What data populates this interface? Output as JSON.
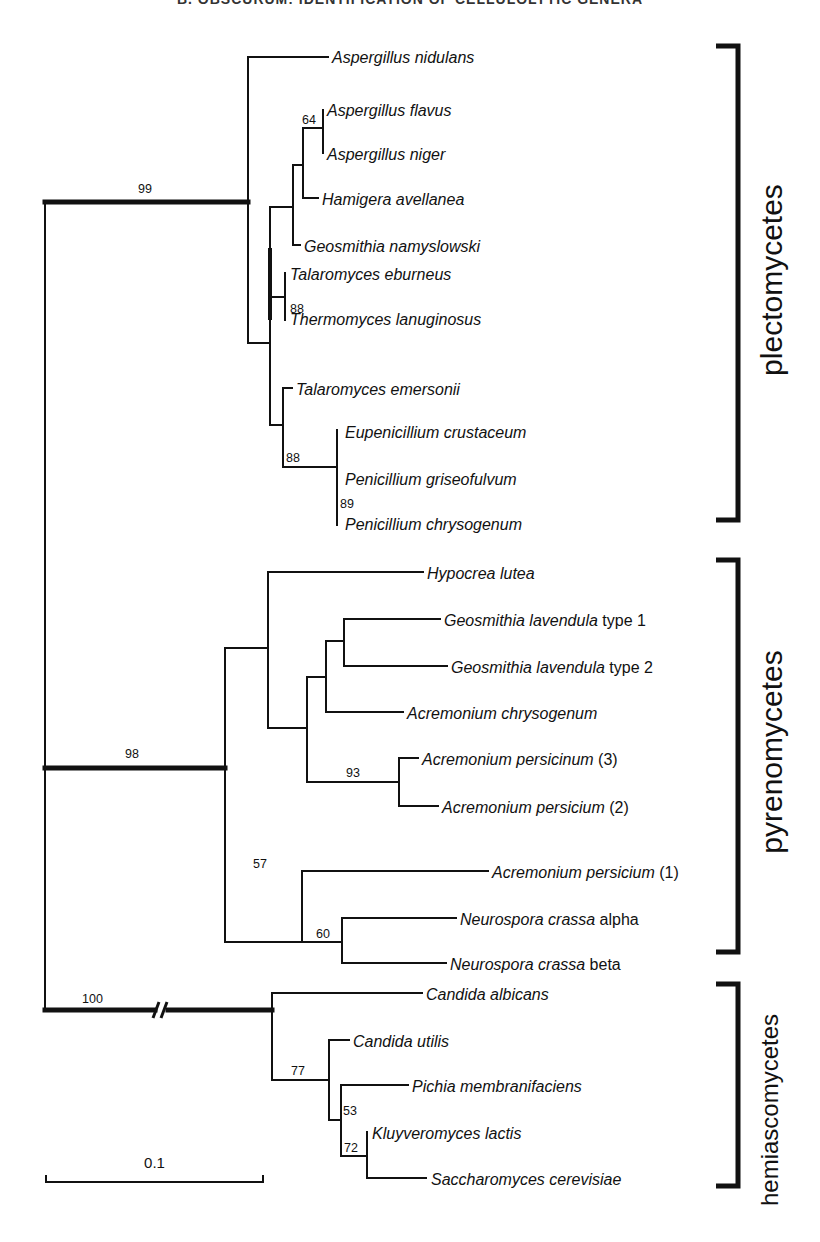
{
  "header": {
    "text": "B. OBSCURUM: IDENTIFICATION OF CELLULOLYTIC GENERA"
  },
  "tree": {
    "stroke_color": "#111111",
    "thin_width": 2,
    "thick_width": 5,
    "branches": [
      {
        "x1": 45,
        "y1": 202,
        "x2": 45,
        "y2": 1010,
        "w": 2
      },
      {
        "x1": 45,
        "y1": 202,
        "x2": 248,
        "y2": 202,
        "w": 5
      },
      {
        "x1": 45,
        "y1": 768,
        "x2": 225,
        "y2": 768,
        "w": 5
      },
      {
        "x1": 45,
        "y1": 1010,
        "x2": 155,
        "y2": 1010,
        "w": 5
      },
      {
        "x1": 168,
        "y1": 1010,
        "x2": 272,
        "y2": 1010,
        "w": 5
      },
      {
        "x1": 248,
        "y1": 57,
        "x2": 248,
        "y2": 343,
        "w": 2
      },
      {
        "x1": 248,
        "y1": 57,
        "x2": 328,
        "y2": 57,
        "w": 2
      },
      {
        "x1": 248,
        "y1": 343,
        "x2": 270,
        "y2": 343,
        "w": 2
      },
      {
        "x1": 270,
        "y1": 207,
        "x2": 270,
        "y2": 425,
        "w": 2
      },
      {
        "x1": 270,
        "y1": 250,
        "x2": 270,
        "y2": 318,
        "w": 4
      },
      {
        "x1": 270,
        "y1": 207,
        "x2": 293,
        "y2": 207,
        "w": 2
      },
      {
        "x1": 293,
        "y1": 165,
        "x2": 293,
        "y2": 245,
        "w": 2
      },
      {
        "x1": 293,
        "y1": 245,
        "x2": 300,
        "y2": 245,
        "w": 2
      },
      {
        "x1": 293,
        "y1": 165,
        "x2": 303,
        "y2": 165,
        "w": 2
      },
      {
        "x1": 303,
        "y1": 128,
        "x2": 303,
        "y2": 198,
        "w": 2
      },
      {
        "x1": 303,
        "y1": 198,
        "x2": 318,
        "y2": 198,
        "w": 2
      },
      {
        "x1": 303,
        "y1": 128,
        "x2": 323,
        "y2": 128,
        "w": 2
      },
      {
        "x1": 323,
        "y1": 110,
        "x2": 323,
        "y2": 153,
        "w": 2
      },
      {
        "x1": 270,
        "y1": 297,
        "x2": 285,
        "y2": 297,
        "w": 2
      },
      {
        "x1": 285,
        "y1": 273,
        "x2": 285,
        "y2": 320,
        "w": 2
      },
      {
        "x1": 270,
        "y1": 425,
        "x2": 283,
        "y2": 425,
        "w": 2
      },
      {
        "x1": 283,
        "y1": 388,
        "x2": 283,
        "y2": 467,
        "w": 2
      },
      {
        "x1": 283,
        "y1": 388,
        "x2": 292,
        "y2": 388,
        "w": 2
      },
      {
        "x1": 283,
        "y1": 467,
        "x2": 337,
        "y2": 467,
        "w": 2
      },
      {
        "x1": 337,
        "y1": 430,
        "x2": 337,
        "y2": 525,
        "w": 2
      },
      {
        "x1": 225,
        "y1": 648,
        "x2": 225,
        "y2": 942,
        "w": 2
      },
      {
        "x1": 225,
        "y1": 648,
        "x2": 268,
        "y2": 648,
        "w": 2
      },
      {
        "x1": 268,
        "y1": 572,
        "x2": 268,
        "y2": 728,
        "w": 2
      },
      {
        "x1": 268,
        "y1": 572,
        "x2": 423,
        "y2": 572,
        "w": 2
      },
      {
        "x1": 268,
        "y1": 728,
        "x2": 307,
        "y2": 728,
        "w": 2
      },
      {
        "x1": 307,
        "y1": 677,
        "x2": 307,
        "y2": 782,
        "w": 2
      },
      {
        "x1": 307,
        "y1": 677,
        "x2": 326,
        "y2": 677,
        "w": 2
      },
      {
        "x1": 326,
        "y1": 641,
        "x2": 326,
        "y2": 712,
        "w": 2
      },
      {
        "x1": 326,
        "y1": 712,
        "x2": 403,
        "y2": 712,
        "w": 2
      },
      {
        "x1": 326,
        "y1": 641,
        "x2": 344,
        "y2": 641,
        "w": 2
      },
      {
        "x1": 344,
        "y1": 619,
        "x2": 344,
        "y2": 666,
        "w": 2
      },
      {
        "x1": 344,
        "y1": 619,
        "x2": 440,
        "y2": 619,
        "w": 2
      },
      {
        "x1": 344,
        "y1": 666,
        "x2": 447,
        "y2": 666,
        "w": 2
      },
      {
        "x1": 307,
        "y1": 782,
        "x2": 399,
        "y2": 782,
        "w": 2
      },
      {
        "x1": 399,
        "y1": 758,
        "x2": 399,
        "y2": 806,
        "w": 2
      },
      {
        "x1": 399,
        "y1": 758,
        "x2": 418,
        "y2": 758,
        "w": 2
      },
      {
        "x1": 399,
        "y1": 806,
        "x2": 438,
        "y2": 806,
        "w": 2
      },
      {
        "x1": 225,
        "y1": 942,
        "x2": 302,
        "y2": 942,
        "w": 2
      },
      {
        "x1": 302,
        "y1": 871,
        "x2": 302,
        "y2": 942,
        "w": 2
      },
      {
        "x1": 302,
        "y1": 871,
        "x2": 488,
        "y2": 871,
        "w": 2
      },
      {
        "x1": 302,
        "y1": 942,
        "x2": 342,
        "y2": 942,
        "w": 2
      },
      {
        "x1": 342,
        "y1": 918,
        "x2": 342,
        "y2": 963,
        "w": 2
      },
      {
        "x1": 342,
        "y1": 918,
        "x2": 456,
        "y2": 918,
        "w": 2
      },
      {
        "x1": 342,
        "y1": 963,
        "x2": 446,
        "y2": 963,
        "w": 2
      },
      {
        "x1": 272,
        "y1": 993,
        "x2": 272,
        "y2": 1080,
        "w": 2
      },
      {
        "x1": 272,
        "y1": 993,
        "x2": 422,
        "y2": 993,
        "w": 2
      },
      {
        "x1": 272,
        "y1": 1080,
        "x2": 329,
        "y2": 1080,
        "w": 2
      },
      {
        "x1": 329,
        "y1": 1040,
        "x2": 329,
        "y2": 1120,
        "w": 2
      },
      {
        "x1": 329,
        "y1": 1040,
        "x2": 349,
        "y2": 1040,
        "w": 2
      },
      {
        "x1": 329,
        "y1": 1120,
        "x2": 341,
        "y2": 1120,
        "w": 2
      },
      {
        "x1": 341,
        "y1": 1085,
        "x2": 341,
        "y2": 1156,
        "w": 2
      },
      {
        "x1": 341,
        "y1": 1085,
        "x2": 408,
        "y2": 1085,
        "w": 2
      },
      {
        "x1": 341,
        "y1": 1156,
        "x2": 367,
        "y2": 1156,
        "w": 2
      },
      {
        "x1": 367,
        "y1": 1132,
        "x2": 367,
        "y2": 1178,
        "w": 2
      },
      {
        "x1": 367,
        "y1": 1178,
        "x2": 426,
        "y2": 1178,
        "w": 2
      }
    ],
    "break_mark": {
      "x": 160,
      "y": 1010,
      "label": "//"
    },
    "tips": [
      {
        "x": 332,
        "y": 63,
        "italic": "Aspergillus nidulans",
        "plain": ""
      },
      {
        "x": 327,
        "y": 116,
        "italic": "Aspergillus flavus",
        "plain": ""
      },
      {
        "x": 327,
        "y": 160,
        "italic": "Aspergillus niger",
        "plain": ""
      },
      {
        "x": 322,
        "y": 205,
        "italic": "Hamigera avellanea",
        "plain": ""
      },
      {
        "x": 304,
        "y": 252,
        "italic": "Geosmithia namyslowski",
        "plain": ""
      },
      {
        "x": 290,
        "y": 280,
        "italic": "Talaromyces eburneus",
        "plain": ""
      },
      {
        "x": 290,
        "y": 325,
        "italic": "Thermomyces lanuginosus",
        "plain": ""
      },
      {
        "x": 296,
        "y": 395,
        "italic": "Talaromyces emersonii",
        "plain": ""
      },
      {
        "x": 345,
        "y": 438,
        "italic": "Eupenicillium crustaceum",
        "plain": ""
      },
      {
        "x": 345,
        "y": 485,
        "italic": "Penicillium griseofulvum",
        "plain": ""
      },
      {
        "x": 345,
        "y": 530,
        "italic": "Penicillium chrysogenum",
        "plain": ""
      },
      {
        "x": 427,
        "y": 579,
        "italic": "Hypocrea lutea",
        "plain": ""
      },
      {
        "x": 444,
        "y": 626,
        "italic": "Geosmithia lavendula",
        "plain": " type 1"
      },
      {
        "x": 451,
        "y": 673,
        "italic": "Geosmithia lavendula",
        "plain": " type 2"
      },
      {
        "x": 407,
        "y": 719,
        "italic": "Acremonium chrysogenum",
        "plain": ""
      },
      {
        "x": 422,
        "y": 765,
        "italic": "Acremonium persicinum",
        "plain": " (3)"
      },
      {
        "x": 442,
        "y": 813,
        "italic": "Acremonium persicium",
        "plain": " (2)"
      },
      {
        "x": 492,
        "y": 878,
        "italic": "Acremonium persicium",
        "plain": " (1)"
      },
      {
        "x": 460,
        "y": 925,
        "italic": "Neurospora crassa",
        "plain": " alpha"
      },
      {
        "x": 450,
        "y": 970,
        "italic": "Neurospora crassa",
        "plain": " beta"
      },
      {
        "x": 426,
        "y": 1000,
        "italic": "Candida albicans",
        "plain": ""
      },
      {
        "x": 353,
        "y": 1047,
        "italic": "Candida utilis",
        "plain": ""
      },
      {
        "x": 412,
        "y": 1092,
        "italic": "Pichia membranifaciens",
        "plain": ""
      },
      {
        "x": 372,
        "y": 1139,
        "italic": "Kluyveromyces lactis",
        "plain": ""
      },
      {
        "x": 431,
        "y": 1185,
        "italic": "Saccharomyces cerevisiae",
        "plain": ""
      }
    ],
    "supports": [
      {
        "x": 138,
        "y": 193,
        "text": "99"
      },
      {
        "x": 302,
        "y": 124,
        "text": "64"
      },
      {
        "x": 290,
        "y": 313,
        "text": "88"
      },
      {
        "x": 286,
        "y": 462,
        "text": "88"
      },
      {
        "x": 340,
        "y": 508,
        "text": "89"
      },
      {
        "x": 125,
        "y": 758,
        "text": "98"
      },
      {
        "x": 346,
        "y": 777,
        "text": "93"
      },
      {
        "x": 253,
        "y": 868,
        "text": "57"
      },
      {
        "x": 316,
        "y": 938,
        "text": "60"
      },
      {
        "x": 82,
        "y": 1003,
        "text": "100"
      },
      {
        "x": 291,
        "y": 1075,
        "text": "77"
      },
      {
        "x": 343,
        "y": 1115,
        "text": "53"
      },
      {
        "x": 344,
        "y": 1152,
        "text": "72"
      }
    ]
  },
  "groups": [
    {
      "name": "plectomycetes",
      "top": 46,
      "bottom": 520,
      "label_y": 280,
      "size": "large"
    },
    {
      "name": "pyrenomycetes",
      "top": 560,
      "bottom": 952,
      "label_y": 752,
      "size": "large"
    },
    {
      "name": "hemiascomycetes",
      "top": 984,
      "bottom": 1186,
      "label_y": 1110,
      "size": "small"
    }
  ],
  "scale_bar": {
    "x1": 46,
    "x2": 263,
    "y": 1182,
    "label": "0.1"
  }
}
